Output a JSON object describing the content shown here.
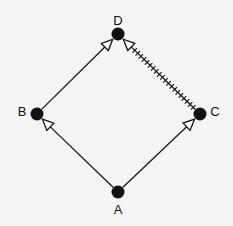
{
  "diagram": {
    "type": "directed-graph",
    "background": "#f4f4f4",
    "ink_color": "#111111",
    "nodes": [
      {
        "id": "A",
        "label": "A",
        "x": 118,
        "y": 192,
        "label_x": 118,
        "label_y": 209
      },
      {
        "id": "B",
        "label": "B",
        "x": 37,
        "y": 114,
        "label_x": 22,
        "label_y": 111
      },
      {
        "id": "C",
        "label": "C",
        "x": 200,
        "y": 114,
        "label_x": 215,
        "label_y": 111
      },
      {
        "id": "D",
        "label": "D",
        "x": 118,
        "y": 34,
        "label_x": 118,
        "label_y": 20
      }
    ],
    "edges": [
      {
        "from": "A",
        "to": "B",
        "style": "solid",
        "arrowhead": "open-triangle"
      },
      {
        "from": "A",
        "to": "C",
        "style": "solid",
        "arrowhead": "open-triangle"
      },
      {
        "from": "B",
        "to": "D",
        "style": "solid",
        "arrowhead": "open-triangle"
      },
      {
        "from": "C",
        "to": "D",
        "style": "hatched",
        "arrowhead": "open-triangle"
      }
    ]
  }
}
